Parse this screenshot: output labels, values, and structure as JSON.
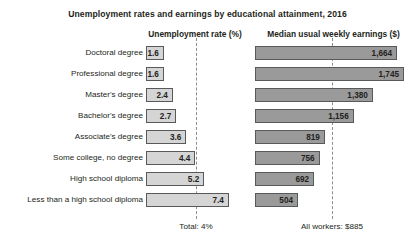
{
  "chart_data": {
    "type": "bar",
    "title": "Unemployment rates and earnings by educational attainment, 2016",
    "orientation": "horizontal",
    "grid": false,
    "legend": "none",
    "categories": [
      "Doctoral degree",
      "Professional degree",
      "Master's degree",
      "Bachelor's degree",
      "Associate's degree",
      "Some college, no degree",
      "High school diploma",
      "Less than a high school diploma"
    ],
    "panels": [
      {
        "name": "unemployment",
        "header": "Unemployment rate (%)",
        "unit": "%",
        "values": [
          1.6,
          1.6,
          2.4,
          2.7,
          3.6,
          4.4,
          5.2,
          7.4
        ],
        "value_labels": [
          "1.6",
          "1.6",
          "2.4",
          "2.7",
          "3.6",
          "4.4",
          "5.2",
          "7.4"
        ],
        "reference_line_value": 4.0,
        "footnote": "Total: 4%",
        "axis_max": 7.4,
        "bar_color": "#d5d5d5",
        "bar_border_color": "#58595b"
      },
      {
        "name": "earnings",
        "header": "Median usual weekly earnings ($)",
        "unit": "$",
        "values": [
          1664,
          1745,
          1380,
          1156,
          819,
          756,
          692,
          504
        ],
        "value_labels": [
          "1,664",
          "1,745",
          "1,380",
          "1,156",
          "819",
          "756",
          "692",
          "504"
        ],
        "reference_line_value": 885,
        "footnote": "All workers: $885",
        "axis_max": 1745,
        "bar_color": "#9a9a9a",
        "bar_border_color": "#58595b"
      }
    ]
  },
  "colors": {
    "text": "#231f20",
    "background": "#ffffff",
    "reference_line": "#8c8c8c"
  }
}
